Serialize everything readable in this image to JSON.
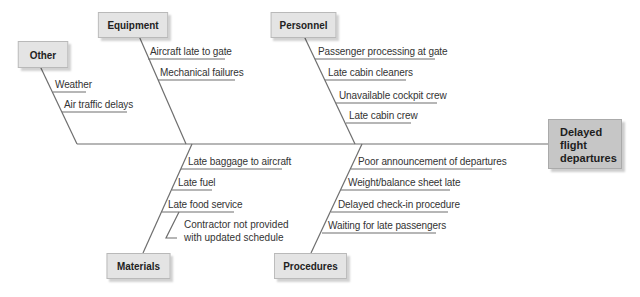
{
  "diagram": {
    "type": "fishbone",
    "effect": {
      "label_lines": [
        "Delayed",
        "flight",
        "departures"
      ]
    },
    "categories": {
      "other": {
        "label": "Other",
        "causes": [
          "Weather",
          "Air traffic delays"
        ]
      },
      "equipment": {
        "label": "Equipment",
        "causes": [
          "Aircraft late to gate",
          "Mechanical failures"
        ]
      },
      "personnel": {
        "label": "Personnel",
        "causes": [
          "Passenger processing at gate",
          "Late cabin cleaners",
          "Unavailable cockpit crew",
          "Late cabin crew"
        ]
      },
      "materials": {
        "label": "Materials",
        "causes": [
          "Late baggage to aircraft",
          "Late fuel",
          "Late food service"
        ],
        "subcauses": {
          "late_food_service": [
            "Contractor not provided",
            "with updated schedule"
          ]
        }
      },
      "procedures": {
        "label": "Procedures",
        "causes": [
          "Poor announcement of departures",
          "Weight/balance sheet late",
          "Delayed check-in procedure",
          "Waiting for late passengers"
        ]
      }
    },
    "colors": {
      "line": "#6e6e6e",
      "category_box": "#e4e4e4",
      "effect_box": "#c6c6c6",
      "text": "#333333"
    }
  }
}
